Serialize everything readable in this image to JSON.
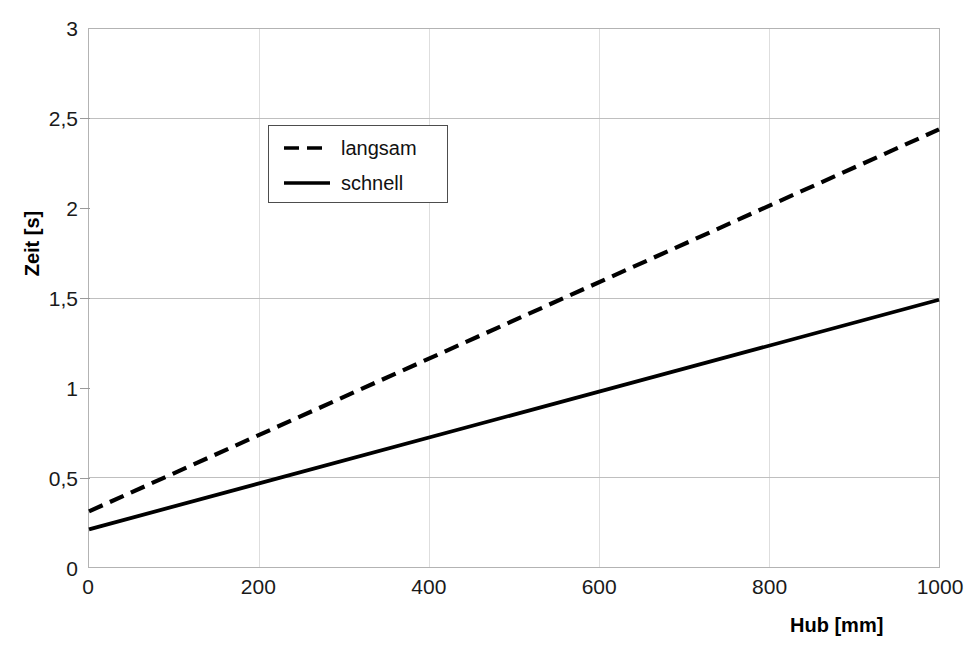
{
  "chart_data": {
    "type": "line",
    "title": "",
    "xlabel": "Hub [mm]",
    "ylabel": "Zeit [s]",
    "xlim": [
      0,
      1000
    ],
    "ylim": [
      0,
      3
    ],
    "xticks": [
      "0",
      "200",
      "400",
      "600",
      "800",
      "1000"
    ],
    "xtick_values": [
      0,
      200,
      400,
      600,
      800,
      1000
    ],
    "yticks": [
      "0",
      "0,5",
      "1",
      "1,5",
      "2",
      "2,5",
      "3"
    ],
    "ytick_values": [
      0,
      0.5,
      1,
      1.5,
      2,
      2.5,
      3
    ],
    "grid": {
      "horizontal": true,
      "vertical": true,
      "horizontal_values": [
        0.5,
        1.5,
        2.5
      ],
      "vertical_values": [
        200,
        400,
        600,
        800
      ],
      "color": "#bfbfbf"
    },
    "legend": {
      "position": "upper-left-inset",
      "entries": [
        {
          "name": "langsam",
          "style": "dashed"
        },
        {
          "name": "schnell",
          "style": "solid"
        }
      ]
    },
    "series": [
      {
        "name": "langsam",
        "style": "dashed",
        "color": "#000000",
        "x": [
          0,
          1000
        ],
        "values": [
          0.31,
          2.44
        ]
      },
      {
        "name": "schnell",
        "style": "solid",
        "color": "#000000",
        "x": [
          0,
          1000
        ],
        "values": [
          0.21,
          1.49
        ]
      }
    ]
  }
}
